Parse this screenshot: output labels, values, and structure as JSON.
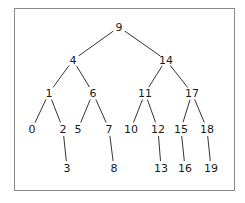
{
  "diagram": {
    "type": "binary-search-tree",
    "root": "9",
    "nodes": [
      {
        "id": "9",
        "label": "9",
        "x": 119,
        "y": 27
      },
      {
        "id": "4",
        "label": "4",
        "x": 73,
        "y": 60
      },
      {
        "id": "14",
        "label": "14",
        "x": 166,
        "y": 60
      },
      {
        "id": "1",
        "label": "1",
        "x": 49,
        "y": 93
      },
      {
        "id": "6",
        "label": "6",
        "x": 93,
        "y": 93
      },
      {
        "id": "11",
        "label": "11",
        "x": 145,
        "y": 93
      },
      {
        "id": "17",
        "label": "17",
        "x": 192,
        "y": 93
      },
      {
        "id": "0",
        "label": "0",
        "x": 32,
        "y": 129
      },
      {
        "id": "2",
        "label": "2",
        "x": 63,
        "y": 129
      },
      {
        "id": "5",
        "label": "5",
        "x": 78,
        "y": 129
      },
      {
        "id": "7",
        "label": "7",
        "x": 109,
        "y": 129
      },
      {
        "id": "10",
        "label": "10",
        "x": 131,
        "y": 129
      },
      {
        "id": "12",
        "label": "12",
        "x": 158,
        "y": 129
      },
      {
        "id": "15",
        "label": "15",
        "x": 181,
        "y": 129
      },
      {
        "id": "18",
        "label": "18",
        "x": 207,
        "y": 129
      },
      {
        "id": "3",
        "label": "3",
        "x": 67,
        "y": 168
      },
      {
        "id": "8",
        "label": "8",
        "x": 114,
        "y": 168
      },
      {
        "id": "13",
        "label": "13",
        "x": 161,
        "y": 168
      },
      {
        "id": "16",
        "label": "16",
        "x": 185,
        "y": 168
      },
      {
        "id": "19",
        "label": "19",
        "x": 211,
        "y": 168
      }
    ],
    "edges": [
      {
        "from": "9",
        "to": "4"
      },
      {
        "from": "9",
        "to": "14"
      },
      {
        "from": "4",
        "to": "1"
      },
      {
        "from": "4",
        "to": "6"
      },
      {
        "from": "14",
        "to": "11"
      },
      {
        "from": "14",
        "to": "17"
      },
      {
        "from": "1",
        "to": "0"
      },
      {
        "from": "1",
        "to": "2"
      },
      {
        "from": "6",
        "to": "5"
      },
      {
        "from": "6",
        "to": "7"
      },
      {
        "from": "11",
        "to": "10"
      },
      {
        "from": "11",
        "to": "12"
      },
      {
        "from": "17",
        "to": "15"
      },
      {
        "from": "17",
        "to": "18"
      },
      {
        "from": "2",
        "to": "3"
      },
      {
        "from": "7",
        "to": "8"
      },
      {
        "from": "12",
        "to": "13"
      },
      {
        "from": "15",
        "to": "16"
      },
      {
        "from": "18",
        "to": "19"
      }
    ]
  },
  "colors": {
    "frame_border": "#8a8a8a",
    "edge": "#333333",
    "label": "#1a1a1a",
    "background": "#ffffff"
  }
}
